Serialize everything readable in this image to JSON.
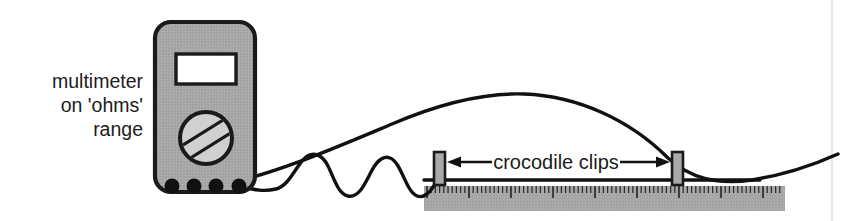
{
  "figure": {
    "width": 844,
    "height": 221,
    "background_color": "#ffffff"
  },
  "labels": {
    "multimeter": {
      "lines": [
        "multimeter",
        "on 'ohms'",
        "range"
      ],
      "line1": "multimeter",
      "line2": "on 'ohms'",
      "line3": "range",
      "align": "right",
      "color": "#1c1c1c",
      "x": 143,
      "y_line1": 88,
      "y_line2": 112,
      "y_line3": 136
    },
    "crocodile_clips": {
      "text": "crocodile clips",
      "color": "#1c1c1c",
      "x": 556,
      "y": 167
    }
  },
  "multimeter": {
    "name": "multimeter",
    "body": {
      "x": 155,
      "y": 22,
      "width": 100,
      "height": 170,
      "radius": 16,
      "fill": "#a9a9a9",
      "stroke": "#1a1a1a"
    },
    "display": {
      "name": "display-screen",
      "x": 176,
      "y": 54,
      "width": 60,
      "height": 30,
      "fill": "#ffffff",
      "stroke": "#1a1a1a"
    },
    "dial": {
      "name": "selector-dial",
      "cx": 206,
      "cy": 138,
      "r": 26,
      "fill": "#d0d0d0",
      "stroke": "#1a1a1a",
      "band_angle_deg": -32
    },
    "ports": [
      {
        "name": "port-1",
        "cx": 172,
        "cy": 186,
        "r": 7.5,
        "fill": "#111111"
      },
      {
        "name": "port-2",
        "cx": 194,
        "cy": 186,
        "r": 7.5,
        "fill": "#111111"
      },
      {
        "name": "port-3",
        "cx": 216,
        "cy": 186,
        "r": 7.5,
        "fill": "#111111"
      },
      {
        "name": "port-4",
        "cx": 239,
        "cy": 186,
        "r": 7.5,
        "fill": "#111111"
      }
    ]
  },
  "wires": {
    "long_arc": {
      "name": "lead-wire-right",
      "description": "smooth lead from port 3 arcing up over the ruler to the right clip then off to the right edge",
      "stroke": "#111111",
      "stroke_width": 3.4,
      "path": "M 216 186 C 270 176 330 150 392 124 C 448 100 492 93 524 94 C 578 96 630 120 668 158 C 690 178 716 185 752 180 C 790 174 818 163 838 154"
    },
    "wavy": {
      "name": "lead-wire-wavy",
      "description": "wavy lead from port 4 to the left crocodile clip, about three oscillations",
      "stroke": "#111111",
      "stroke_width": 3.4,
      "path": "M 239 186 C 255 190 264 192 276 189 C 288 186 294 170 303 160 C 312 150 322 154 328 166 C 334 178 338 194 348 196 C 358 198 364 186 370 174 C 376 162 382 155 390 158 C 398 161 402 175 408 186 C 414 197 420 199 427 194 C 433 190 437 180 441 173"
    }
  },
  "crocodile_clips": [
    {
      "name": "crocodile-clip-left",
      "x": 434,
      "y": 152,
      "width": 11,
      "height": 33,
      "fill": "#a9a9a9",
      "stroke": "#1a1a1a"
    },
    {
      "name": "crocodile-clip-right",
      "x": 672,
      "y": 152,
      "width": 11,
      "height": 33,
      "fill": "#a9a9a9",
      "stroke": "#1a1a1a"
    }
  ],
  "measured_wire": {
    "name": "wire-under-test",
    "description": "straight dark wire lying along the top of the ruler between the clips",
    "x1": 424,
    "x2": 760,
    "y": 180,
    "stroke": "#111111",
    "stroke_width": 3.2
  },
  "dimension_arrow": {
    "name": "crocodile-clips-dimension-arrow",
    "description": "double headed arrow spanning between the two crocodile clips",
    "left_x": 447,
    "right_x": 670,
    "y": 162,
    "color": "#111111",
    "head_length": 13,
    "head_width": 11
  },
  "ruler": {
    "name": "ruler",
    "x": 424,
    "y": 186,
    "width": 361,
    "height": 25,
    "fill": "#a8a8a8",
    "tick_color": "#2b2b2b",
    "tick_spacing_px": 4.2,
    "minor_tick_height": 7,
    "major_tick_height": 12,
    "major_every": 10,
    "tick_count": 86
  },
  "page_edge": {
    "name": "page-edge-line",
    "x": 832,
    "y1": 0,
    "y2": 221,
    "color": "#e2e2e2"
  },
  "colors": {
    "ink": "#111111",
    "outline": "#1a1a1a",
    "device_gray": "#a9a9a9",
    "dial_gray": "#d0d0d0",
    "ruler_gray": "#a8a8a8",
    "background": "#ffffff",
    "page_edge": "#e2e2e2"
  }
}
